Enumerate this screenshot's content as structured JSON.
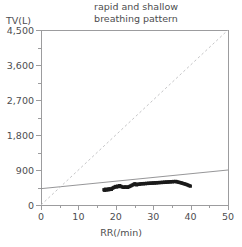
{
  "chart_data": {
    "type": "scatter",
    "title": "rapid and shallow\nbreathing pattern",
    "xlabel": "RR(/min)",
    "ylabel": "TV(L)",
    "xlim": [
      0,
      50
    ],
    "ylim": [
      0,
      4500
    ],
    "xticks": [
      0,
      10,
      20,
      30,
      40,
      50
    ],
    "xtick_labels": [
      "0",
      "10",
      "20",
      "30",
      "40",
      "50"
    ],
    "yticks": [
      0,
      900,
      1800,
      2700,
      3600,
      4500
    ],
    "ytick_labels": [
      "0",
      "900",
      "1,800",
      "2,700",
      "3,600",
      "4,500"
    ],
    "x_minor_step": 5,
    "y_minor_step": 450,
    "grid": false,
    "legend": null,
    "marker_color": "#1a1a1a",
    "series": [
      {
        "name": "breath-by-breath measurements",
        "type": "scatter",
        "points": [
          [
            16.8,
            395
          ],
          [
            17.0,
            380
          ],
          [
            17.2,
            410
          ],
          [
            17.4,
            388
          ],
          [
            17.6,
            402
          ],
          [
            17.9,
            392
          ],
          [
            18.1,
            420
          ],
          [
            18.3,
            400
          ],
          [
            18.6,
            415
          ],
          [
            18.8,
            405
          ],
          [
            19.0,
            430
          ],
          [
            19.3,
            445
          ],
          [
            19.5,
            455
          ],
          [
            19.8,
            470
          ],
          [
            20.0,
            480
          ],
          [
            20.2,
            465
          ],
          [
            20.5,
            490
          ],
          [
            20.7,
            475
          ],
          [
            21.0,
            500
          ],
          [
            21.3,
            485
          ],
          [
            21.6,
            470
          ],
          [
            21.9,
            460
          ],
          [
            22.2,
            455
          ],
          [
            22.5,
            470
          ],
          [
            22.8,
            462
          ],
          [
            23.1,
            455
          ],
          [
            23.4,
            468
          ],
          [
            23.7,
            480
          ],
          [
            24.0,
            495
          ],
          [
            24.3,
            510
          ],
          [
            24.6,
            525
          ],
          [
            24.9,
            540
          ],
          [
            25.1,
            548
          ],
          [
            25.3,
            535
          ],
          [
            25.5,
            520
          ],
          [
            25.8,
            530
          ],
          [
            26.1,
            542
          ],
          [
            26.4,
            536
          ],
          [
            26.7,
            548
          ],
          [
            27.0,
            552
          ],
          [
            27.3,
            545
          ],
          [
            27.6,
            556
          ],
          [
            27.9,
            550
          ],
          [
            28.2,
            560
          ],
          [
            28.5,
            555
          ],
          [
            28.8,
            565
          ],
          [
            29.1,
            558
          ],
          [
            29.4,
            568
          ],
          [
            29.7,
            562
          ],
          [
            30.0,
            572
          ],
          [
            30.3,
            566
          ],
          [
            30.6,
            575
          ],
          [
            30.9,
            570
          ],
          [
            31.2,
            580
          ],
          [
            31.5,
            574
          ],
          [
            31.8,
            584
          ],
          [
            32.1,
            578
          ],
          [
            32.4,
            588
          ],
          [
            32.7,
            582
          ],
          [
            33.0,
            592
          ],
          [
            33.3,
            586
          ],
          [
            33.6,
            596
          ],
          [
            33.9,
            590
          ],
          [
            34.2,
            600
          ],
          [
            34.5,
            595
          ],
          [
            34.8,
            604
          ],
          [
            35.1,
            598
          ],
          [
            35.4,
            608
          ],
          [
            35.7,
            602
          ],
          [
            36.0,
            610
          ],
          [
            36.3,
            600
          ],
          [
            36.6,
            592
          ],
          [
            36.9,
            586
          ],
          [
            37.2,
            578
          ],
          [
            37.5,
            570
          ],
          [
            37.8,
            562
          ],
          [
            38.1,
            552
          ],
          [
            38.4,
            545
          ],
          [
            38.7,
            535
          ],
          [
            39.0,
            525
          ],
          [
            39.3,
            512
          ],
          [
            39.6,
            500
          ],
          [
            39.9,
            488
          ]
        ]
      }
    ],
    "lines": [
      {
        "name": "regression-line",
        "style": "solid",
        "color": "#8a8a8c",
        "from": [
          0,
          420
        ],
        "to": [
          50,
          900
        ]
      },
      {
        "name": "identity-reference-line",
        "style": "dashed",
        "color": "#bdbdbf",
        "from": [
          0,
          0
        ],
        "to": [
          50,
          4500
        ]
      }
    ]
  }
}
